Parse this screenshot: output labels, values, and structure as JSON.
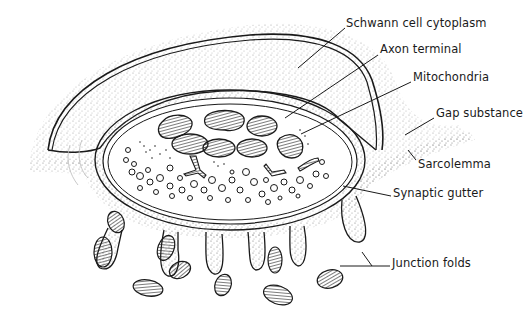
{
  "figure": {
    "labels": [
      {
        "id": "schwann",
        "text": "Schwann cell cytoplasm",
        "x": 346,
        "y": 23
      },
      {
        "id": "axon",
        "text": "Axon terminal",
        "x": 380,
        "y": 49
      },
      {
        "id": "mito",
        "text": "Mitochondria",
        "x": 413,
        "y": 77
      },
      {
        "id": "gap",
        "text": "Gap substance",
        "x": 436,
        "y": 113
      },
      {
        "id": "sarco",
        "text": "Sarcolemma",
        "x": 418,
        "y": 164
      },
      {
        "id": "gutter",
        "text": "Synaptic gutter",
        "x": 393,
        "y": 193
      },
      {
        "id": "folds",
        "text": "Junction folds",
        "x": 392,
        "y": 263
      }
    ],
    "colors": {
      "ink": "#1a1a1a",
      "stipple": "#9a9a9a",
      "background": "#ffffff"
    }
  }
}
